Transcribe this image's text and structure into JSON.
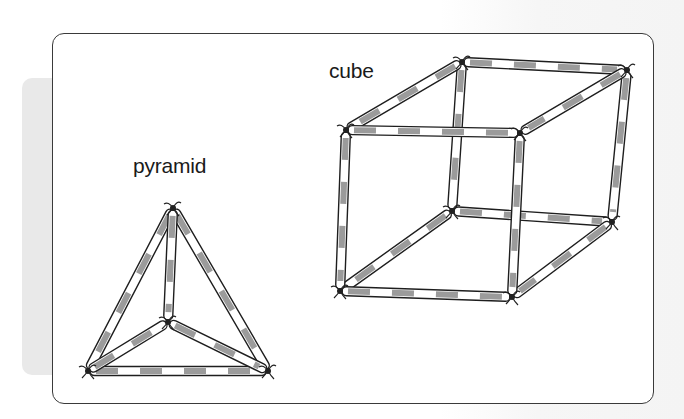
{
  "figure": {
    "type": "illustration",
    "labels": {
      "pyramid": "pyramid",
      "cube": "cube"
    },
    "colors": {
      "straw_outline": "#1e1e1e",
      "straw_fill": "#ffffff",
      "straw_stripe": "#8a8a8a",
      "card_border": "#3a3a3a",
      "side_tab": "#e9e9e9"
    },
    "shapes": [
      {
        "name": "pyramid",
        "kind": "tetrahedron",
        "straw_count": 6,
        "knot_count": 4,
        "vertices": {
          "apex": [
            173,
            208
          ],
          "base_left": [
            88,
            371
          ],
          "base_right": [
            268,
            371
          ],
          "base_back": [
            168,
            322
          ]
        },
        "edges": [
          [
            "apex",
            "base_left"
          ],
          [
            "apex",
            "base_right"
          ],
          [
            "apex",
            "base_back"
          ],
          [
            "base_left",
            "base_right"
          ],
          [
            "base_left",
            "base_back"
          ],
          [
            "base_back",
            "base_right"
          ]
        ]
      },
      {
        "name": "cube",
        "kind": "cube",
        "straw_count": 12,
        "knot_count": 8,
        "vertices": {
          "ftl": [
            346,
            130
          ],
          "ftr": [
            520,
            133
          ],
          "fbl": [
            340,
            291
          ],
          "fbr": [
            512,
            297
          ],
          "btl": [
            462,
            62
          ],
          "btr": [
            627,
            70
          ],
          "bbl": [
            452,
            211
          ],
          "bbr": [
            612,
            222
          ]
        },
        "edges": [
          [
            "btl",
            "btr"
          ],
          [
            "btl",
            "bbl"
          ],
          [
            "btr",
            "bbr"
          ],
          [
            "bbl",
            "bbr"
          ],
          [
            "btl",
            "ftl"
          ],
          [
            "btr",
            "ftr"
          ],
          [
            "bbl",
            "fbl"
          ],
          [
            "bbr",
            "fbr"
          ],
          [
            "ftl",
            "ftr"
          ],
          [
            "ftl",
            "fbl"
          ],
          [
            "ftr",
            "fbr"
          ],
          [
            "fbl",
            "fbr"
          ]
        ]
      }
    ]
  }
}
